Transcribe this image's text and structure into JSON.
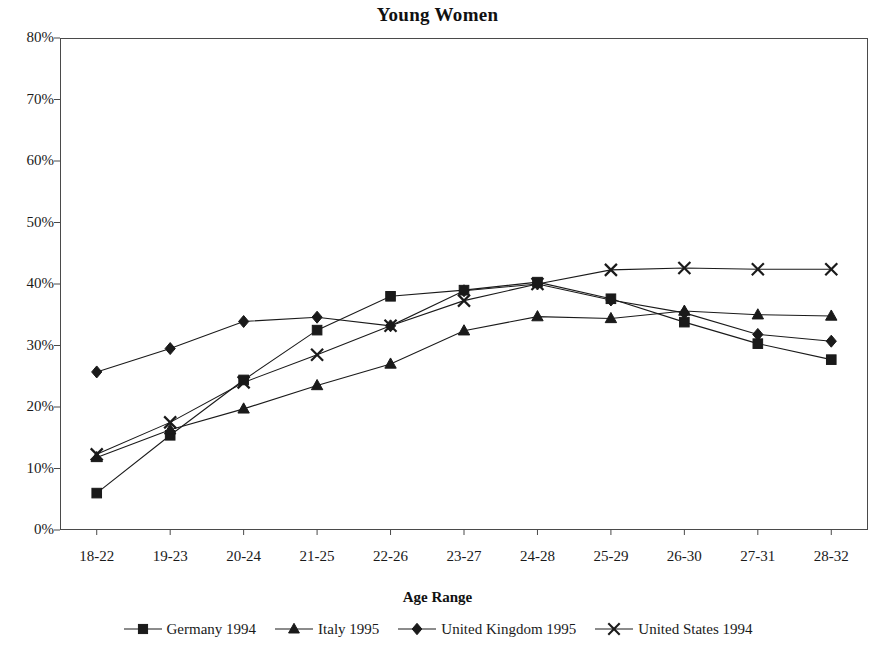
{
  "chart_data": {
    "type": "line",
    "title": "Young Women",
    "xlabel": "Age Range",
    "ylabel": "",
    "categories": [
      "18-22",
      "19-23",
      "20-24",
      "21-25",
      "22-26",
      "23-27",
      "24-28",
      "25-29",
      "26-30",
      "27-31",
      "28-32"
    ],
    "ylim": [
      0,
      80
    ],
    "ytick_labels": [
      "0%",
      "10%",
      "20%",
      "30%",
      "40%",
      "50%",
      "60%",
      "70%",
      "80%"
    ],
    "ytick_values": [
      0,
      10,
      20,
      30,
      40,
      50,
      60,
      70,
      80
    ],
    "grid": false,
    "legend_position": "bottom",
    "value_unit": "%",
    "series": [
      {
        "name": "Germany 1994",
        "marker": "square",
        "color": "#1a1a1a",
        "values": [
          6.0,
          15.4,
          24.4,
          32.5,
          38.0,
          39.0,
          40.3,
          37.6,
          33.8,
          30.3,
          27.7
        ]
      },
      {
        "name": "Italy 1995",
        "marker": "triangle",
        "color": "#1a1a1a",
        "values": [
          11.8,
          16.3,
          19.7,
          23.5,
          27.0,
          32.4,
          34.7,
          34.4,
          35.6,
          35.0,
          34.8
        ]
      },
      {
        "name": "United Kingdom 1995",
        "marker": "diamond",
        "color": "#1a1a1a",
        "values": [
          25.7,
          29.5,
          33.9,
          34.6,
          33.2,
          38.9,
          40.0,
          37.4,
          35.3,
          31.8,
          30.7
        ]
      },
      {
        "name": "United States 1994",
        "marker": "x",
        "color": "#1a1a1a",
        "values": [
          12.3,
          17.5,
          24.0,
          28.5,
          33.2,
          37.3,
          40.0,
          42.3,
          42.6,
          42.4,
          42.4
        ]
      }
    ]
  },
  "legend": {
    "items": [
      {
        "label": "Germany 1994"
      },
      {
        "label": "Italy 1995"
      },
      {
        "label": "United Kingdom 1995"
      },
      {
        "label": "United States 1994"
      }
    ]
  }
}
